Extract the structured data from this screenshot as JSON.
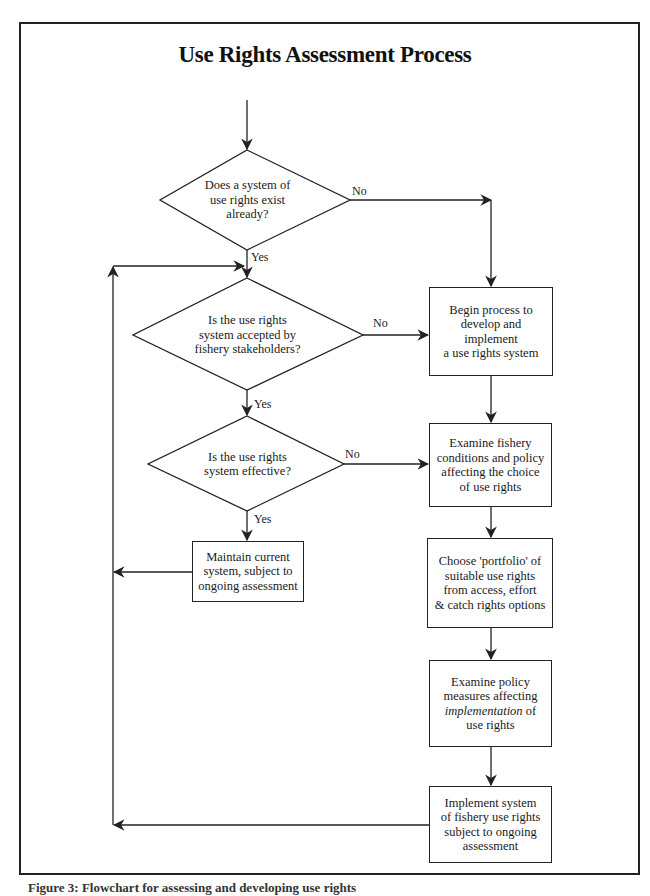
{
  "title": "Use Rights Assessment Process",
  "decisions": [
    {
      "id": "d1",
      "line1": "Does a system of",
      "line2": "use rights exist",
      "line3": "already?",
      "yes_label": "Yes",
      "no_label": "No"
    },
    {
      "id": "d2",
      "line1": "Is the use rights",
      "line2": "system accepted by",
      "line3": "fishery stakeholders?",
      "yes_label": "Yes",
      "no_label": "No"
    },
    {
      "id": "d3",
      "line1": "Is the use rights",
      "line2": "system effective?",
      "yes_label": "Yes",
      "no_label": "No"
    }
  ],
  "processes": [
    {
      "id": "p_maintain",
      "lines": [
        "Maintain current",
        "system, subject to",
        "ongoing assessment"
      ]
    },
    {
      "id": "p_begin",
      "lines": [
        "Begin process to",
        "develop and implement",
        "a use rights system"
      ]
    },
    {
      "id": "p_examine_conditions",
      "lines": [
        "Examine fishery",
        "conditions and policy",
        "affecting the choice",
        "of use rights"
      ]
    },
    {
      "id": "p_choose",
      "lines": [
        "Choose 'portfolio' of",
        "suitable use rights",
        "from access, effort",
        "& catch rights options"
      ]
    },
    {
      "id": "p_examine_policy",
      "line1": "Examine policy",
      "line2": "measures affecting",
      "line3_italic": "implementation",
      "line3_rest": " of",
      "line4": "use rights"
    },
    {
      "id": "p_implement",
      "lines": [
        "Implement system",
        "of fishery use rights",
        "subject to ongoing",
        "assessment"
      ]
    }
  ],
  "caption": "Figure 3: Flowchart for assessing and developing use rights",
  "colors": {
    "line": "#222222",
    "background": "#ffffff",
    "text": "#1a1a1a"
  }
}
